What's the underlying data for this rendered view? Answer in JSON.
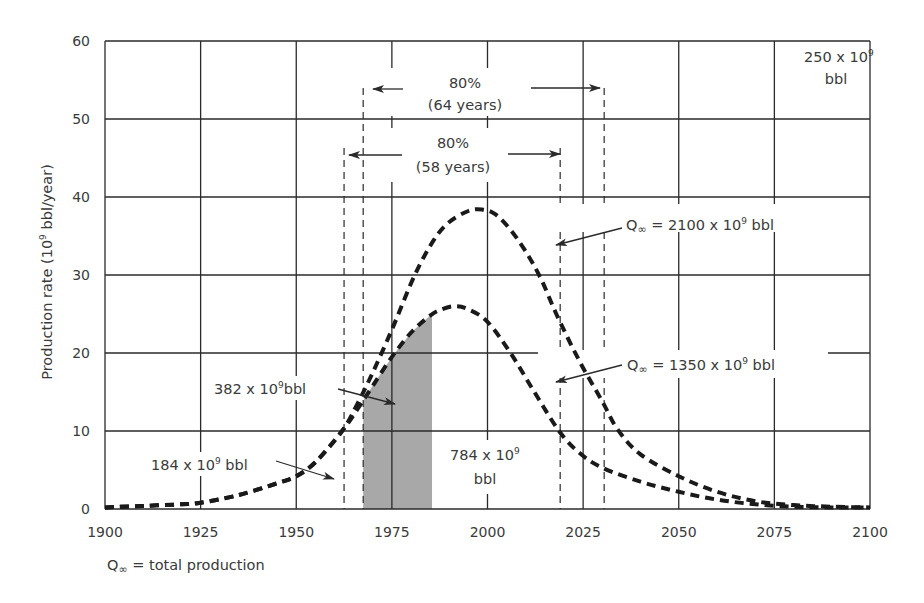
{
  "chart_data": {
    "type": "line",
    "title": "",
    "xlabel": "",
    "ylabel": "Production rate (10⁹ bbl/year)",
    "xlim": [
      1900,
      2100
    ],
    "ylim": [
      0,
      60
    ],
    "grid": true,
    "x_ticks": [
      1900,
      1925,
      1950,
      1975,
      2000,
      2025,
      2050,
      2075,
      2100
    ],
    "y_ticks": [
      0,
      10,
      20,
      30,
      40,
      50,
      60
    ],
    "series": [
      {
        "name": "Q∞ = 2100 x 10⁹ bbl",
        "style": "dashed",
        "x": [
          1900,
          1910,
          1920,
          1925,
          1935,
          1945,
          1950,
          1955,
          1962,
          1966,
          1970,
          1975,
          1981,
          1986,
          1990,
          1995,
          1998.5,
          2002,
          2006,
          2010,
          2014,
          2018,
          2024,
          2030,
          2034,
          2040,
          2050,
          2060,
          2070,
          2080,
          2090,
          2100
        ],
        "values": [
          0.2,
          0.4,
          0.6,
          0.8,
          1.8,
          3.3,
          4.2,
          6.0,
          10.0,
          13.5,
          17.5,
          23.0,
          30.0,
          34.5,
          36.8,
          38.2,
          38.4,
          37.8,
          35.8,
          33.0,
          29.5,
          25.0,
          19.0,
          13.8,
          10.2,
          7.0,
          4.2,
          2.2,
          1.0,
          0.5,
          0.3,
          0.2
        ]
      },
      {
        "name": "Q∞ = 1350 x 10⁹ bbl",
        "style": "dashed",
        "x": [
          1900,
          1910,
          1920,
          1925,
          1935,
          1945,
          1950,
          1955,
          1962,
          1966,
          1970,
          1975,
          1980,
          1985,
          1988,
          1991.5,
          1995,
          2000,
          2006,
          2012,
          2018.7,
          2024,
          2030,
          2040,
          2050,
          2060,
          2070,
          2080,
          2090,
          2100
        ],
        "values": [
          0.2,
          0.4,
          0.6,
          0.8,
          1.8,
          3.3,
          4.2,
          6.0,
          10.0,
          12.8,
          15.8,
          19.5,
          22.6,
          24.8,
          25.6,
          26.0,
          25.6,
          24.0,
          20.0,
          15.2,
          10.0,
          7.2,
          5.3,
          3.5,
          2.2,
          1.2,
          0.6,
          0.3,
          0.2,
          0.2
        ]
      }
    ],
    "shaded_region": {
      "x_from": 1967.5,
      "x_to": 1985.5,
      "series": "Q∞ = 1350 x 10⁹ bbl",
      "color": "#a8a8a8"
    },
    "dashed_markers": [
      1962.5,
      1967.5,
      2019,
      2030.5
    ],
    "annotations": [
      {
        "id": "span64",
        "line1": "80%",
        "line2": "(64 years)"
      },
      {
        "id": "span58",
        "line1": "80%",
        "line2": "(58 years)"
      },
      {
        "id": "q2100",
        "text": "Q∞ = 2100 x 10⁹ bbl"
      },
      {
        "id": "q1350",
        "text": "Q∞ = 1350 x 10⁹ bbl"
      },
      {
        "id": "v382",
        "text": "382 x 10⁹ bbl"
      },
      {
        "id": "v184",
        "text": "184 x 10⁹ bbl"
      },
      {
        "id": "v784",
        "line1": "784 x 10⁹",
        "line2": "bbl"
      },
      {
        "id": "v250",
        "line1": "250 x 10⁹",
        "line2": "bbl"
      }
    ],
    "footnote": "Q∞ = total production"
  },
  "labels": {
    "ylabel_main": "Production rate (10",
    "ylabel_sup": "9",
    "ylabel_tail": " bbl/year)",
    "span64_pct": "80%",
    "span64_years": "(64 years)",
    "span58_pct": "80%",
    "span58_years": "(58 years)",
    "q2100_pre": "Q",
    "q2100_inf": "∞",
    "q2100_main": " = 2100 x 10",
    "q2100_sup": "9",
    "q2100_tail": " bbl",
    "q1350_pre": "Q",
    "q1350_inf": "∞",
    "q1350_main": " = 1350 x 10",
    "q1350_sup": "9",
    "q1350_tail": " bbl",
    "v382_main": "382 x 10",
    "v382_sup": "9",
    "v382_tail": "bbl",
    "v184_main": "184 x 10",
    "v184_sup": "9",
    "v184_tail": " bbl",
    "v784_main": "784 x 10",
    "v784_sup": "9",
    "v784_line2": "bbl",
    "v250_main": "250 x 10",
    "v250_sup": "9",
    "v250_line2": "bbl",
    "foot_pre": "Q",
    "foot_inf": "∞",
    "foot_tail": " = total production"
  }
}
